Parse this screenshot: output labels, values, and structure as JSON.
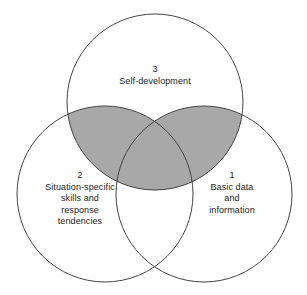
{
  "figure": {
    "type": "venn-diagram",
    "set_count": 3,
    "background_color": "#ffffff",
    "stroke_color": "#444444",
    "stroke_width": 1,
    "shade_color": "#a8a8a8",
    "text_color": "#1a1a1a"
  },
  "circles": [
    {
      "id": "top",
      "number": "3",
      "cx": 155,
      "cy": 102,
      "r": 88,
      "lines": [
        "Self-development"
      ],
      "filled": false
    },
    {
      "id": "left",
      "number": "2",
      "cx": 105,
      "cy": 194,
      "r": 88,
      "lines": [
        "Situation-specific",
        "skills and",
        "response",
        "tendencies"
      ],
      "filled": false
    },
    {
      "id": "right",
      "number": "1",
      "cx": 204,
      "cy": 194,
      "r": 88,
      "lines": [
        "Basic data",
        "and",
        "information"
      ],
      "filled": false
    }
  ],
  "shaded_regions": [
    {
      "id": "top-left-overlap",
      "sets": [
        "3",
        "2"
      ],
      "color": "#a8a8a8"
    },
    {
      "id": "top-right-overlap",
      "sets": [
        "3",
        "1"
      ],
      "color": "#a8a8a8"
    },
    {
      "id": "center-overlap",
      "sets": [
        "3",
        "2",
        "1"
      ],
      "color": "#a8a8a8"
    }
  ],
  "labels": {
    "top": {
      "number": "3",
      "line1": "Self-development"
    },
    "left": {
      "number": "2",
      "line1": "Situation-specific",
      "line2": "skills and",
      "line3": "response",
      "line4": "tendencies"
    },
    "right": {
      "number": "1",
      "line1": "Basic data",
      "line2": "and",
      "line3": "information"
    }
  }
}
